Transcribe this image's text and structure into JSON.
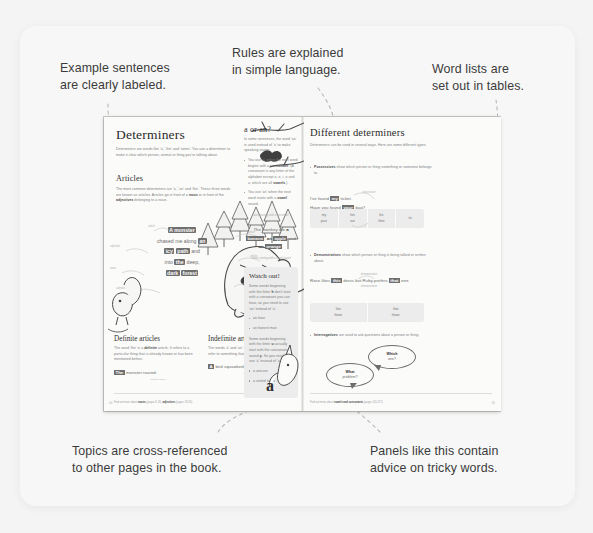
{
  "annotations": {
    "top_left": [
      "Example sentences",
      "are clearly labeled."
    ],
    "top_center": [
      "Rules are explained",
      "in simple language."
    ],
    "top_right": [
      "Word lists are",
      "set out in tables."
    ],
    "bottom_left": [
      "Topics are cross-referenced",
      "to other pages in the book."
    ],
    "bottom_right": [
      "Panels like this contain",
      "advice on tricky words."
    ]
  },
  "book": {
    "left_page": {
      "title": "Determiners",
      "intro": "Determiners are words like 'a', 'the' and 'some'. You use a determiner to make it clear which person, animal or thing you're talking about.",
      "articles_heading": "Articles",
      "articles_body_1": "The most common determiners are 'a', 'an' and 'the'. These three words are known as articles. Articles go in front of a ",
      "articles_bold_1": "noun",
      "articles_body_2": " or in front of the ",
      "articles_bold_2": "adjectives",
      "articles_body_3": " belonging to a noun.",
      "example": {
        "line1_pre": "",
        "line1_hl": "A monster",
        "line2_pre": "chased me along ",
        "line2_hl": "an",
        "line3_hl1": "icy",
        "line3_hl2": "path",
        "line3_post": " and",
        "line4_pre": "into ",
        "line4_hl": "the",
        "line4_post": " deep,",
        "line5_hl1": "dark",
        "line5_hl2": "forest",
        "labels": [
          "article",
          "article",
          "adjective",
          "noun",
          "article",
          "adjective",
          "noun"
        ]
      },
      "definite": {
        "heading": "Definite articles",
        "body_pre": "The word 'the' is a ",
        "body_bold": "definite",
        "body_post": " article. It refers to a particular thing that is already known or has been mentioned before.",
        "example_hl": "The",
        "example_rest": " monster roared.",
        "caption": "definite article"
      },
      "indefinite": {
        "heading": "Indefinite articles",
        "body_pre": "The words 'a' and 'an' are ",
        "body_bold": "indefinite",
        "body_post": " articles. They refer to something that is not specific or known.",
        "example_hl": "A",
        "example_rest": " bird squawked.",
        "caption": "indefinite article"
      },
      "footnote_pre": "Find out more about ",
      "footnote_b1": "nouns",
      "footnote_mid": " (pages 8-13), ",
      "footnote_b2": "adjectives",
      "footnote_post": " (pages 18-20).",
      "page_number": "44"
    },
    "middle_panel": {
      "heading": "a or an?",
      "intro": "In some sentences, the word 'an' is used instead of 'a' to make speaking easier.",
      "bullet_1_pre": "You use 'a' when the next word begins with a ",
      "bullet_1_bold": "consonant",
      "bullet_1_post": ". (A consonant is any letter of the alphabet except a, e, i, o and u, which are all ",
      "bullet_1_bold2": "vowels",
      "bullet_1_end": ".)",
      "bullet_2_pre": "You use 'an' when the next word starts with a ",
      "bullet_2_bold": "vowel",
      "bullet_2_post": " sound.",
      "note_top": "word starting with a consonant",
      "example_pre": "The monkey ate ",
      "example_b1": "a",
      "example_hl1": "banana",
      "example_comma": ",",
      "example_b2": "an",
      "example_hl2": "apple",
      "example_and": " and ",
      "example_b3": "an",
      "example_hl3": "orange",
      "example_end": ".",
      "note_bottom": "words starting with a vowel sound",
      "watch_heading": "Watch out!",
      "watch_body_1_pre": "Some words beginning with the letter ",
      "watch_body_1_b": "h",
      "watch_body_1_post": " don't start with a consonant you can hear, so you need to use 'an' instead of 'a'.",
      "watch_bullets_1": [
        "an hour",
        "an honest man"
      ],
      "watch_body_2_pre": "Some words beginning with the letter ",
      "watch_body_2_b": "u",
      "watch_body_2_mid": " actually start with the consonant sound ",
      "watch_body_2_b2": "y",
      "watch_body_2_post": ". So you need to use 'a' instead of 'an'.",
      "watch_bullets_2": [
        "a unicorn",
        "a united team"
      ],
      "letter_prop": "a"
    },
    "right_page": {
      "title": "Different determiners",
      "intro": "Determiners can be used in several ways. Here are some different types.",
      "possessives": {
        "bold": "Possessives",
        "text": " show which person or thing something or someone belongs to.",
        "note": "possessive",
        "example_1_pre": "I've found ",
        "example_1_hl": "my",
        "example_1_post": " ticket.",
        "example_2_pre": "Have you found ",
        "example_2_hl": "your",
        "example_2_post": " bag?",
        "note2": "possessive",
        "table": [
          [
            "my",
            "your"
          ],
          [
            "her",
            "our"
          ],
          [
            "his",
            "their"
          ],
          [
            "its",
            ""
          ]
        ]
      },
      "demonstratives": {
        "bold": "Demonstratives",
        "text": " show which person or thing is being talked or written about.",
        "note": "demonstrative",
        "example_pre": "Rose likes ",
        "example_hl1": "this",
        "example_mid": " dress but Ruby prefers ",
        "example_hl2": "that",
        "example_post": " one.",
        "note2": "demonstrative",
        "table": [
          [
            "this",
            "these"
          ],
          [
            "that",
            "those"
          ]
        ]
      },
      "interrogatives": {
        "bold": "Interrogatives",
        "text": " are used to ask questions about a person or thing.",
        "bubble_1_bold": "Which",
        "bubble_1_rest": "one?",
        "bubble_2_bold": "What",
        "bubble_2_rest": "problem?"
      },
      "footnote_pre": "Find out more about ",
      "footnote_b1": "vowels and consonants",
      "footnote_post": " (pages 116-117).",
      "page_number": "45"
    }
  },
  "colors": {
    "canvas": "#f4f4f4",
    "card": "#f7f7f7",
    "book_paper": "#fbfbfa",
    "panel_grey": "#ececec",
    "highlight": "#6f6f6f",
    "caption_text": "#3b3b3b"
  }
}
